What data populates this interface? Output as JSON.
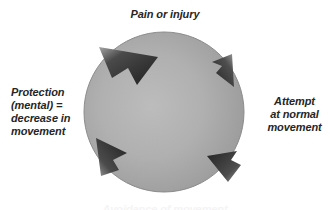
{
  "diagram": {
    "type": "cyclic-flow",
    "direction": "clockwise",
    "labels": {
      "top": "Pain or injury",
      "right": "Attempt\nat normal\nmovement",
      "left": "Protection\n(mental) =\ndecrease in\nmovement",
      "bottom": "Avoidance of movement"
    },
    "arrow_count": 4,
    "colors": {
      "circle_light": "#b6b6b6",
      "circle_mid": "#a2a2a2",
      "circle_dark": "#8a8a8a",
      "arrow_dark": "#2b2b2b",
      "arrow_light": "#8d8d8d",
      "text": "#262626",
      "background": "#ffffff"
    },
    "circle": {
      "center_x": 164,
      "center_y": 112,
      "radius": 80
    }
  }
}
